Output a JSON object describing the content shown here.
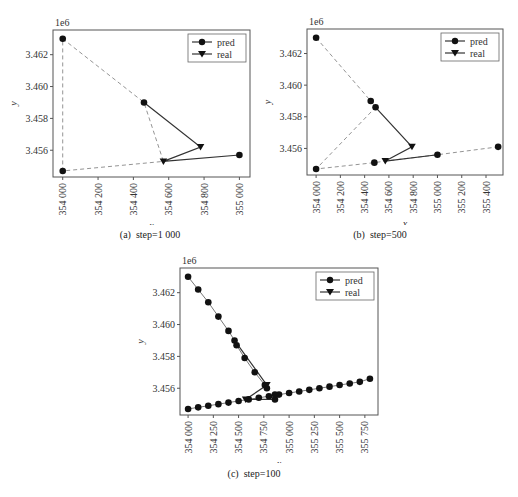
{
  "chart_data": [
    {
      "id": "a",
      "type": "line",
      "caption": "(a)  step=1 000",
      "xlabel": "x",
      "ylabel": "y",
      "y_offset_label": "1e6",
      "xlim": [
        353945,
        355060
      ],
      "ylim": [
        3.45432,
        3.46355
      ],
      "xticks": [
        354000,
        354200,
        354400,
        354600,
        354800,
        355000
      ],
      "xtick_labels": [
        "354 000",
        "354 200",
        "354 400",
        "354 600",
        "354 800",
        "355 000"
      ],
      "yticks": [
        3.456,
        3.458,
        3.46,
        3.462
      ],
      "ytick_labels": [
        "3.456",
        "3.458",
        "3.460",
        "3.462"
      ],
      "legend": [
        "pred",
        "real"
      ],
      "legend_position": "upper right",
      "grid": false,
      "series": [
        {
          "name": "pred",
          "marker": "circle",
          "style": "dashed",
          "x": [
            354000,
            354460,
            354570,
            354000,
            354000
          ],
          "y": [
            3.463,
            3.459,
            3.4553,
            3.4547,
            3.463
          ]
        },
        {
          "name": "real",
          "marker": "triangle-down",
          "style": "solid",
          "x": [
            354460,
            354780,
            354570,
            355000
          ],
          "y": [
            3.459,
            3.4562,
            3.4553,
            3.4557
          ]
        }
      ],
      "pred_markers": {
        "x": [
          354000,
          354460,
          355000,
          354000
        ],
        "y": [
          3.463,
          3.459,
          3.4557,
          3.4547
        ]
      },
      "real_markers": {
        "x": [
          354780,
          354570
        ],
        "y": [
          3.4562,
          3.4553
        ]
      }
    },
    {
      "id": "b",
      "type": "line",
      "caption": "(b)  step=500",
      "xlabel": "x",
      "ylabel": "y",
      "y_offset_label": "1e6",
      "xlim": [
        353925,
        355540
      ],
      "ylim": [
        3.45432,
        3.46355
      ],
      "xticks": [
        354000,
        354200,
        354400,
        354600,
        354800,
        355000,
        355200,
        355400
      ],
      "xtick_labels": [
        "354 000",
        "354 200",
        "354 400",
        "354 600",
        "354 800",
        "355 000",
        "355 200",
        "355 400"
      ],
      "yticks": [
        3.456,
        3.458,
        3.46,
        3.462
      ],
      "ytick_labels": [
        "3.456",
        "3.458",
        "3.460",
        "3.462"
      ],
      "legend": [
        "pred",
        "real"
      ],
      "legend_position": "upper right",
      "grid": false,
      "series": [
        {
          "name": "pred",
          "marker": "circle",
          "style": "dashed",
          "x": [
            354000,
            354450,
            354490,
            354000,
            354480,
            354570,
            355000,
            355500
          ],
          "y": [
            3.463,
            3.459,
            3.4586,
            3.4547,
            3.4551,
            3.4552,
            3.4556,
            3.4561
          ]
        },
        {
          "name": "real",
          "marker": "triangle-down",
          "style": "solid",
          "x": [
            354490,
            354790,
            354570,
            355000
          ],
          "y": [
            3.4586,
            3.4561,
            3.4552,
            3.4556
          ]
        }
      ],
      "pred_markers": {
        "x": [
          354000,
          354450,
          354490,
          354000,
          354480,
          355000,
          355500
        ],
        "y": [
          3.463,
          3.459,
          3.4586,
          3.4547,
          3.4551,
          3.4556,
          3.4561
        ]
      },
      "real_markers": {
        "x": [
          354790,
          354570
        ],
        "y": [
          3.4561,
          3.4552
        ]
      }
    },
    {
      "id": "c",
      "type": "line",
      "caption": "(c)  step=100",
      "xlabel": "x",
      "ylabel": "y",
      "y_offset_label": "1e6",
      "xlim": [
        353920,
        355880
      ],
      "ylim": [
        3.45432,
        3.46355
      ],
      "xticks": [
        354000,
        354250,
        354500,
        354750,
        355000,
        355250,
        355500,
        355750
      ],
      "xtick_labels": [
        "354 000",
        "354 250",
        "354 500",
        "354 750",
        "355 000",
        "355 250",
        "355 500",
        "355 750"
      ],
      "yticks": [
        3.456,
        3.458,
        3.46,
        3.462
      ],
      "ytick_labels": [
        "3.456",
        "3.458",
        "3.460",
        "3.462"
      ],
      "legend": [
        "pred",
        "real"
      ],
      "legend_position": "upper right",
      "grid": false,
      "series": [
        {
          "name": "pred",
          "marker": "circle",
          "style": "solid-gray",
          "x": [
            354000,
            354100,
            354200,
            354300,
            354400,
            354460,
            354480,
            354560,
            354660,
            354760,
            354780
          ],
          "y": [
            3.463,
            3.4622,
            3.4614,
            3.4605,
            3.4596,
            3.459,
            3.4587,
            3.4579,
            3.457,
            3.4562,
            3.456
          ]
        },
        {
          "name": "pred-lower",
          "marker": "circle",
          "style": "solid-gray",
          "x": [
            354000,
            354100,
            354200,
            354300,
            354400,
            354500,
            354600,
            354700,
            354800,
            354900,
            355000,
            355100,
            355200,
            355300,
            355400,
            355500,
            355600,
            355700,
            355800
          ],
          "y": [
            3.4547,
            3.4548,
            3.4549,
            3.455,
            3.4551,
            3.4552,
            3.4553,
            3.4554,
            3.4555,
            3.4556,
            3.4557,
            3.4558,
            3.4559,
            3.456,
            3.4561,
            3.4562,
            3.4563,
            3.4564,
            3.4566
          ]
        },
        {
          "name": "real",
          "marker": "triangle-down",
          "style": "solid",
          "x": [
            354460,
            354780,
            354570,
            354860,
            354860
          ],
          "y": [
            3.459,
            3.4562,
            3.4553,
            3.4553,
            3.4556
          ]
        }
      ],
      "pred_markers": {
        "x": [
          354860,
          354860
        ],
        "y": [
          3.4553,
          3.4556
        ]
      },
      "real_markers": {
        "x": [
          354780,
          354570
        ],
        "y": [
          3.4562,
          3.4553
        ]
      }
    }
  ]
}
